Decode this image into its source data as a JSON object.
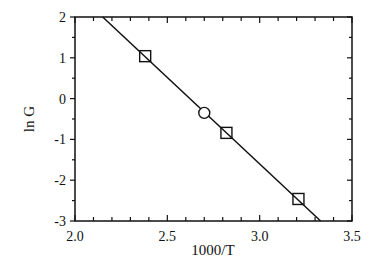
{
  "chart_data": {
    "type": "scatter",
    "title": "",
    "xlabel": "1000/T",
    "ylabel": "ln G",
    "xlim": [
      2.0,
      3.5
    ],
    "ylim": [
      -3,
      2
    ],
    "grid": false,
    "legend": null,
    "x_ticks": [
      "2.0",
      "2.5",
      "3.0",
      "3.5"
    ],
    "y_ticks": [
      "2",
      "1",
      "0",
      "-1",
      "-2",
      "-3"
    ],
    "series": [
      {
        "name": "squares",
        "marker": "square",
        "x": [
          2.38,
          2.82,
          3.21
        ],
        "y": [
          1.04,
          -0.84,
          -2.46
        ]
      },
      {
        "name": "circle",
        "marker": "circle",
        "x": [
          2.7
        ],
        "y": [
          -0.35
        ]
      }
    ],
    "fit_line": {
      "x": [
        2.15,
        3.33
      ],
      "y": [
        2.0,
        -3.0
      ]
    }
  }
}
